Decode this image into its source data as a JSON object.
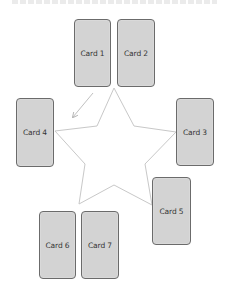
{
  "canvas": {
    "width": 233,
    "height": 298,
    "background": "#ffffff"
  },
  "colors": {
    "card_fill": "#d3d3d3",
    "card_border": "#6b6b6b",
    "card_text": "#333333",
    "star_stroke": "#c8c8c8",
    "arrow_stroke": "#c0c0c0"
  },
  "cards": [
    {
      "id": "card-1",
      "label": "Card 1",
      "x": 74,
      "y": 19,
      "w": 37,
      "h": 68
    },
    {
      "id": "card-2",
      "label": "Card 2",
      "x": 117,
      "y": 19,
      "w": 38,
      "h": 68
    },
    {
      "id": "card-3",
      "label": "Card 3",
      "x": 176,
      "y": 98,
      "w": 38,
      "h": 68
    },
    {
      "id": "card-4",
      "label": "Card 4",
      "x": 16,
      "y": 98,
      "w": 38,
      "h": 69
    },
    {
      "id": "card-5",
      "label": "Card 5",
      "x": 152,
      "y": 177,
      "w": 39,
      "h": 68
    },
    {
      "id": "card-6",
      "label": "Card 6",
      "x": 39,
      "y": 211,
      "w": 37,
      "h": 68
    },
    {
      "id": "card-7",
      "label": "Card 7",
      "x": 81,
      "y": 211,
      "w": 38,
      "h": 68
    }
  ],
  "star": {
    "points": "114,88 134,126 176,132 145,164 152,205 114,185 79,204 85,164 55,131 97,126"
  },
  "arrow": {
    "x1": 93,
    "y1": 93,
    "x2": 73,
    "y2": 117
  }
}
